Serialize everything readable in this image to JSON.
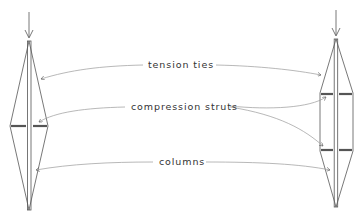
{
  "diagram": {
    "labels": {
      "tension_ties": "tension ties",
      "compression_struts": "compression struts",
      "columns": "columns"
    },
    "structures": [
      {
        "name": "single-strut-truss",
        "strut_count": 1
      },
      {
        "name": "double-strut-truss",
        "strut_count": 2
      }
    ],
    "colors": {
      "line": "#555555",
      "leader": "#999999",
      "text": "#333333"
    }
  }
}
